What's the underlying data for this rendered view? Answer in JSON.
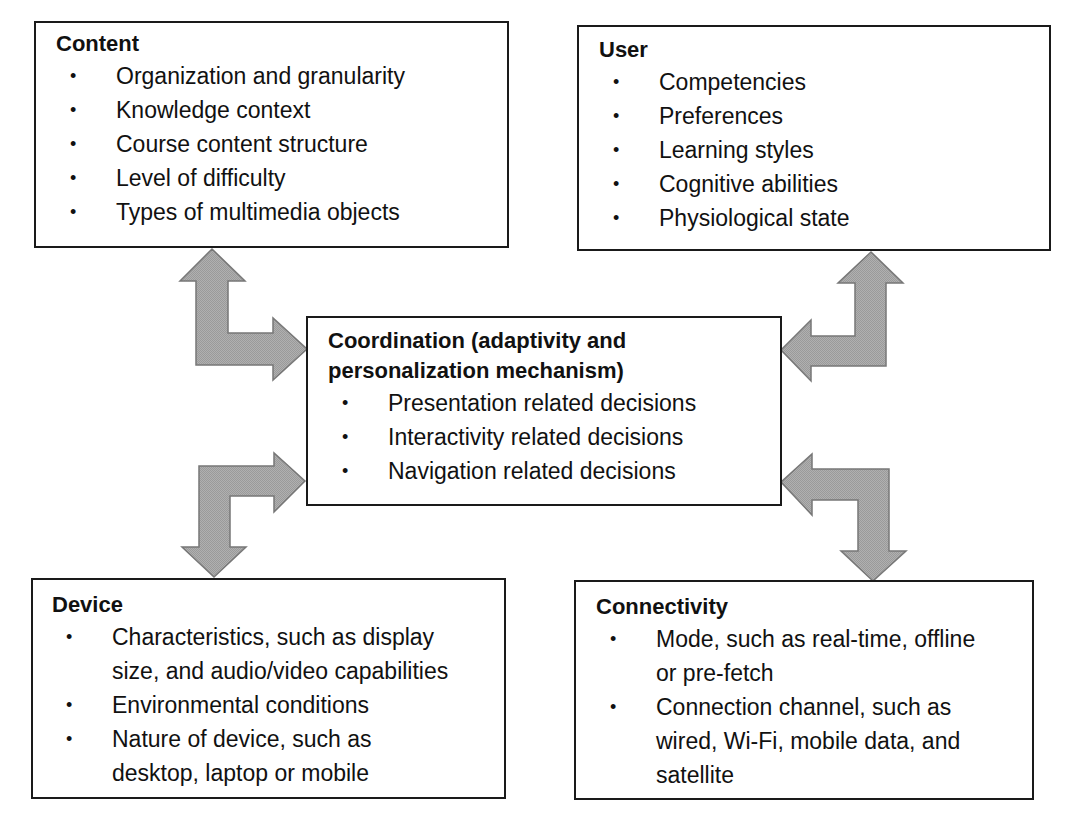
{
  "diagram": {
    "colors": {
      "border": "#1a1a1a",
      "arrow_fill": "#a8a8a8",
      "arrow_stroke": "#777777",
      "text": "#111111"
    },
    "boxes": {
      "content": {
        "title": "Content",
        "items": [
          {
            "lines": [
              "Organization and granularity"
            ]
          },
          {
            "lines": [
              "Knowledge context"
            ]
          },
          {
            "lines": [
              "Course content structure"
            ]
          },
          {
            "lines": [
              "Level of difficulty"
            ]
          },
          {
            "lines": [
              "Types of multimedia objects"
            ]
          }
        ]
      },
      "user": {
        "title": "User",
        "items": [
          {
            "lines": [
              "Competencies"
            ]
          },
          {
            "lines": [
              "Preferences"
            ]
          },
          {
            "lines": [
              "Learning styles"
            ]
          },
          {
            "lines": [
              "Cognitive abilities"
            ]
          },
          {
            "lines": [
              "Physiological state"
            ]
          }
        ]
      },
      "coordination": {
        "title_lines": [
          "Coordination (adaptivity and",
          "personalization mechanism)"
        ],
        "items": [
          {
            "lines": [
              "Presentation related decisions"
            ]
          },
          {
            "lines": [
              "Interactivity related decisions"
            ]
          },
          {
            "lines": [
              "Navigation related decisions"
            ]
          }
        ]
      },
      "device": {
        "title": "Device",
        "items": [
          {
            "lines": [
              "Characteristics, such as display",
              "size, and audio/video capabilities"
            ]
          },
          {
            "lines": [
              "Environmental conditions"
            ]
          },
          {
            "lines": [
              "Nature of device, such as",
              "desktop, laptop or mobile"
            ]
          }
        ]
      },
      "connectivity": {
        "title": "Connectivity",
        "items": [
          {
            "lines": [
              "Mode, such as real-time, offline",
              "or pre-fetch"
            ]
          },
          {
            "lines": [
              "Connection channel, such as",
              "wired, Wi-Fi, mobile data, and",
              "satellite"
            ]
          }
        ]
      }
    },
    "bullet_glyph": "•",
    "arrows": [
      {
        "name": "content-coordination-arrow",
        "from": "content",
        "to": "coordination",
        "bidirectional": true
      },
      {
        "name": "user-coordination-arrow",
        "from": "user",
        "to": "coordination",
        "bidirectional": true
      },
      {
        "name": "device-coordination-arrow",
        "from": "device",
        "to": "coordination",
        "bidirectional": true
      },
      {
        "name": "connectivity-coordination-arrow",
        "from": "connectivity",
        "to": "coordination",
        "bidirectional": true
      }
    ]
  }
}
